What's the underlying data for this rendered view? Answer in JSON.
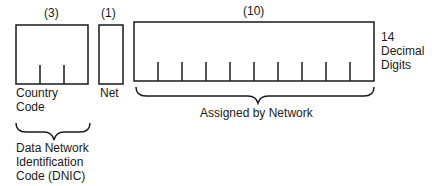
{
  "diagram": {
    "fields": [
      {
        "id": "country",
        "count_label": "(3)",
        "digits": 3,
        "name": "Country Code",
        "name_lines": [
          "Country",
          "Code"
        ]
      },
      {
        "id": "net",
        "count_label": "(1)",
        "digits": 1,
        "name": "Net",
        "name_lines": [
          "Net"
        ]
      },
      {
        "id": "assigned",
        "count_label": "(10)",
        "digits": 10,
        "name": "Assigned by Network"
      }
    ],
    "total_label_lines": [
      "14",
      "Decimal",
      "Digits"
    ],
    "dnic_label_lines": [
      "Data Network",
      "Identification",
      "Code (DNIC)"
    ],
    "assigned_brace_label": "Assigned by Network",
    "colors": {
      "stroke": "#1a1a1a",
      "background": "#ffffff"
    }
  }
}
